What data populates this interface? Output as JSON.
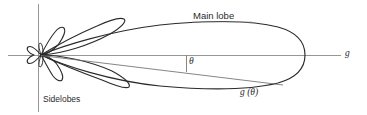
{
  "figure": {
    "type": "antenna-radiation-pattern-diagram",
    "background_color": "#ffffff",
    "stroke_color": "#2b2b2b",
    "axis_color": "#8a8a8a",
    "width": 367,
    "height": 115
  },
  "labels": {
    "main_lobe": "Main lobe",
    "sidelobes": "Sidelobes",
    "theta": "θ",
    "g_theta": "g (θ)",
    "g_axis": "g"
  },
  "geometry": {
    "origin_x": 41,
    "origin_y": 55,
    "horizontal_axis_y": 55,
    "horizontal_axis_x_start": 8,
    "horizontal_axis_x_end": 341,
    "vertical_axis_x": 38,
    "vertical_axis_y_start": 4,
    "vertical_axis_y_end": 112,
    "main_lobe_tip_x": 303,
    "main_lobe_top_y": 22,
    "main_lobe_bottom_y": 88,
    "theta_tick_x": 186,
    "theta_tick_y_top": 55,
    "theta_tick_y_bottom": 72,
    "g_theta_ray_end_x": 283,
    "g_theta_ray_end_y": 85
  },
  "elements": {
    "main_lobe_name": "main-lobe",
    "upper_sidelobe_name": "upper-sidelobe",
    "lower_sidelobe_name": "lower-sidelobe",
    "back_lobes_name": "back-lobes"
  }
}
